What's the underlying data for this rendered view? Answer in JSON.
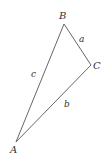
{
  "diagram": {
    "type": "triangle",
    "stroke_color": "#555555",
    "label_color": "#333333",
    "vertices": [
      {
        "label": "A",
        "x": 16,
        "y": 142
      },
      {
        "label": "B",
        "x": 64,
        "y": 24
      },
      {
        "label": "C",
        "x": 91,
        "y": 65
      }
    ],
    "sides": [
      {
        "label": "a",
        "from": "B",
        "to": "C"
      },
      {
        "label": "b",
        "from": "C",
        "to": "A"
      },
      {
        "label": "c",
        "from": "A",
        "to": "B"
      }
    ]
  }
}
